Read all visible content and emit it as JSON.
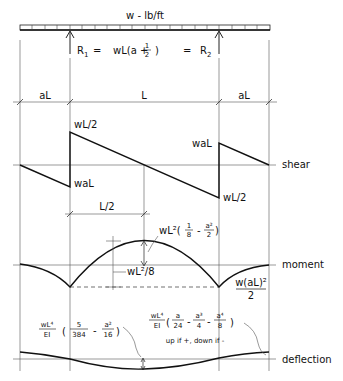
{
  "load": {
    "label": "w - lb/ft"
  },
  "reactions": {
    "r1": "R",
    "r1_sub": "1",
    "eq1": "=",
    "formula": "wL(a +",
    "frac_num": "1",
    "frac_den": "2",
    "close": ")",
    "eq2": "=",
    "r2": "R",
    "r2_sub": "2"
  },
  "dimensions": {
    "left": "aL",
    "middle": "L",
    "right": "aL",
    "half": "L/2"
  },
  "shear": {
    "label": "shear",
    "left_peak": "wL/2",
    "left_neg": "waL",
    "right_peak": "waL",
    "right_neg": "wL/2"
  },
  "moment": {
    "label": "moment",
    "peak_formula": "wL²(",
    "peak_f1_num": "1",
    "peak_f1_den": "8",
    "peak_minus": "-",
    "peak_f2_num": "a²",
    "peak_f2_den": "2",
    "peak_close": ")",
    "simple_span": "wL²/8",
    "support_num": "w(aL)²",
    "support_den": "2"
  },
  "deflection": {
    "label": "deflection",
    "mid_coef_num": "wL⁴",
    "mid_coef_den": "EI",
    "mid_f1_num": "5",
    "mid_f1_den": "384",
    "mid_minus": "-",
    "mid_f2_num": "a²",
    "mid_f2_den": "16",
    "end_coef_num": "wL⁴",
    "end_coef_den": "EI",
    "end_f1_num": "a",
    "end_f1_den": "24",
    "end_f2_num": "a³",
    "end_f2_den": "4",
    "end_f3_num": "a⁴",
    "end_f3_den": "8",
    "note": "up if +, down if -"
  }
}
